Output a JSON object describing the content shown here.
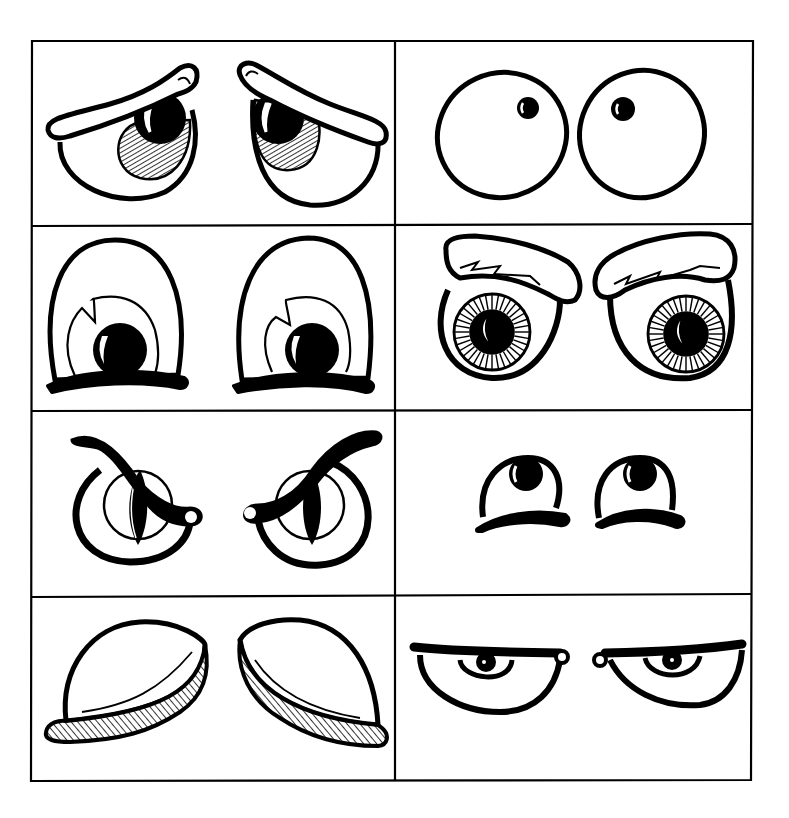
{
  "sheet": {
    "title": "Cartoon eye styles reference sheet",
    "columns": 2,
    "rows": 4,
    "ink_color": "#000000",
    "paper_color": "#ffffff",
    "cells": [
      {
        "label": "droopy-sad-eyes"
      },
      {
        "label": "oval-eyes-small-pupils"
      },
      {
        "label": "dome-eyes-looking-down"
      },
      {
        "label": "bushy-brow-eyes"
      },
      {
        "label": "angry-slit-eyes"
      },
      {
        "label": "small-eyes-looking-up"
      },
      {
        "label": "closed-lashed-eyelids"
      },
      {
        "label": "sleepy-half-closed-eyes"
      }
    ]
  }
}
